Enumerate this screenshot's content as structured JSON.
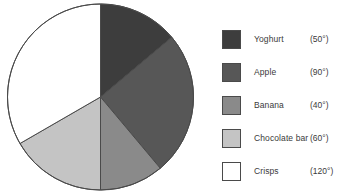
{
  "chart_data": {
    "type": "pie",
    "title": "",
    "start_angle_deg": 0,
    "direction": "clockwise",
    "total_deg": 360,
    "categories": [
      "Yoghurt",
      "Apple",
      "Banana",
      "Chocolate bar",
      "Crisps"
    ],
    "values": [
      50,
      90,
      40,
      60,
      120
    ],
    "value_unit": "degrees",
    "value_labels": [
      "(50°)",
      "(90°)",
      "(40°)",
      "(60°)",
      "(120°)"
    ],
    "colors": [
      "#3d3d3d",
      "#575757",
      "#8a8a8a",
      "#c4c4c4",
      "#ffffff"
    ],
    "slice_outline_color": "#4a4a4a",
    "legend_position": "right",
    "grid": false,
    "series": [
      {
        "name": "Favourite snack",
        "slices": [
          {
            "label": "Yoghurt",
            "degrees": 50,
            "color": "#3d3d3d",
            "value_label": "(50°)"
          },
          {
            "label": "Apple",
            "degrees": 90,
            "color": "#575757",
            "value_label": "(90°)"
          },
          {
            "label": "Banana",
            "degrees": 40,
            "color": "#8a8a8a",
            "value_label": "(40°)"
          },
          {
            "label": "Chocolate bar",
            "degrees": 60,
            "color": "#c4c4c4",
            "value_label": "(60°)"
          },
          {
            "label": "Crisps",
            "degrees": 120,
            "color": "#ffffff",
            "value_label": "(120°)"
          }
        ]
      }
    ]
  },
  "background_color": "#ffffff"
}
